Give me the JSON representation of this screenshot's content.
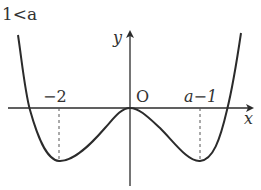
{
  "diagram": {
    "condition_label": "1<a",
    "axes": {
      "x_label": "x",
      "y_label": "y",
      "origin_label": "O"
    },
    "tick_labels": {
      "left_min": "−2",
      "right_min": "a−1"
    },
    "curve": {
      "description": "quartic-shaped graph with two local minima at x=-2 and x=a-1, touching the x-axis at the origin",
      "minima_x": [
        "-2",
        "a-1"
      ],
      "tangent_point": "O"
    },
    "colors": {
      "stroke": "#2b2b2b",
      "text": "#333333",
      "background": "#ffffff"
    }
  }
}
